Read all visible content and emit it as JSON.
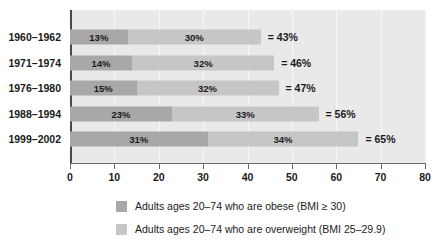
{
  "chart_data": {
    "type": "bar",
    "orientation": "horizontal",
    "stacked": true,
    "title": "",
    "xlabel": "",
    "ylabel": "",
    "xlim": [
      0,
      80
    ],
    "xticks": [
      0,
      10,
      20,
      30,
      40,
      50,
      60,
      70,
      80
    ],
    "xtick_labels": [
      "0",
      "10",
      "20",
      "30",
      "40",
      "50",
      "60",
      "70",
      "80"
    ],
    "grid": true,
    "grid_axis": "x",
    "legend_position": "bottom",
    "categories": [
      "1960–1962",
      "1971–1974",
      "1976–1980",
      "1988–1994",
      "1999–2002"
    ],
    "series": [
      {
        "name": "Adults ages 20–74 who are obese (BMI ≥ 30)",
        "color": "#a8a8a8",
        "values": [
          13,
          14,
          15,
          23,
          31
        ],
        "labels": [
          "13%",
          "14%",
          "15%",
          "23%",
          "31%"
        ]
      },
      {
        "name": "Adults ages 20–74 who are overweight (BMI 25–29.9)",
        "color": "#c6c6c6",
        "values": [
          30,
          32,
          32,
          33,
          34
        ],
        "labels": [
          "30%",
          "32%",
          "32%",
          "33%",
          "34%"
        ]
      }
    ],
    "totals": [
      43,
      46,
      47,
      56,
      65
    ],
    "total_labels": [
      "= 43%",
      "= 46%",
      "= 47%",
      "= 56%",
      "= 65%"
    ]
  },
  "plot": {
    "background_color": "#e9e9e9",
    "gridline_color": "#f7f7f7",
    "axis_color": "#4a4a4a"
  },
  "legend": {
    "items": [
      {
        "label": "Adults ages 20–74 who are obese (BMI ≥ 30)",
        "color": "#a8a8a8"
      },
      {
        "label": "Adults ages 20–74 who are overweight (BMI 25–29.9)",
        "color": "#c6c6c6"
      }
    ]
  }
}
